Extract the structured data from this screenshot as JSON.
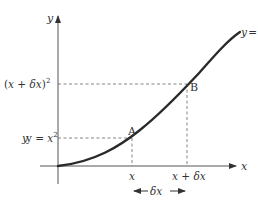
{
  "diagram": {
    "axes": {
      "x_label": "x",
      "y_label": "y"
    },
    "curve_label": {
      "y": "y = ",
      "x": "x",
      "exp": "2"
    },
    "points": [
      {
        "name": "A",
        "label": "A"
      },
      {
        "name": "B",
        "label": "B"
      }
    ],
    "y_ticks": {
      "low": {
        "prefix": "y = ",
        "x": "x",
        "exp": "2"
      },
      "high": {
        "open": "(",
        "x": "x",
        "plus": " + ",
        "dx": "δx",
        "close": ")",
        "exp": "2"
      }
    },
    "x_ticks": {
      "low": "x",
      "high_x": "x",
      "high_plus": " + ",
      "high_dx": "δx"
    },
    "delta_label": "δx",
    "colors": {
      "curve": "#2a2a2a",
      "axis": "#555555",
      "dashed": "#777777",
      "text": "#333333"
    }
  }
}
